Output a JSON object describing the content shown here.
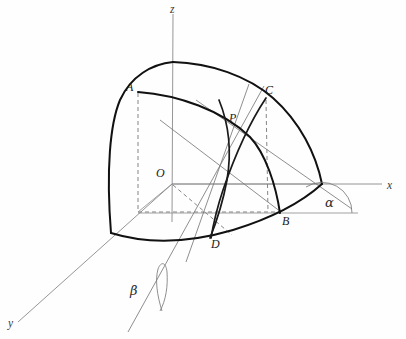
{
  "figure": {
    "background_color": "#fefefe",
    "width": 406,
    "height": 339,
    "stroke_dark": "#111111",
    "stroke_thin": "#8a8a8a",
    "stroke_dashed": "#6f6f6f"
  },
  "axes": [
    {
      "key": "z",
      "label": "z",
      "label_x": 170,
      "label_y": 4
    },
    {
      "key": "x",
      "label": "x",
      "label_x": 387,
      "label_y": 180
    },
    {
      "key": "y",
      "label": "y",
      "label_x": 8,
      "label_y": 318
    }
  ],
  "points": [
    {
      "key": "A",
      "label": "A",
      "label_x": 126,
      "label_y": 81,
      "px": 138,
      "py": 92
    },
    {
      "key": "C",
      "label": "C",
      "label_x": 265,
      "label_y": 84,
      "px": 266,
      "py": 98
    },
    {
      "key": "P",
      "label": "P",
      "label_x": 229,
      "label_y": 112,
      "px": 238,
      "py": 126
    },
    {
      "key": "O",
      "label": "O",
      "label_x": 156,
      "label_y": 167,
      "px": 172,
      "py": 184
    },
    {
      "key": "B",
      "label": "B",
      "label_x": 282,
      "label_y": 215,
      "px": 280,
      "py": 213
    },
    {
      "key": "D",
      "label": "D",
      "label_x": 211,
      "label_y": 238,
      "px": 211,
      "py": 237
    }
  ],
  "angles": [
    {
      "key": "alpha",
      "label": "α",
      "label_x": 325,
      "label_y": 196,
      "vertex_x": 322,
      "vertex_y": 213
    },
    {
      "key": "beta",
      "label": "β",
      "label_x": 130,
      "label_y": 284,
      "vertex_x": 160,
      "vertex_y": 310
    }
  ]
}
